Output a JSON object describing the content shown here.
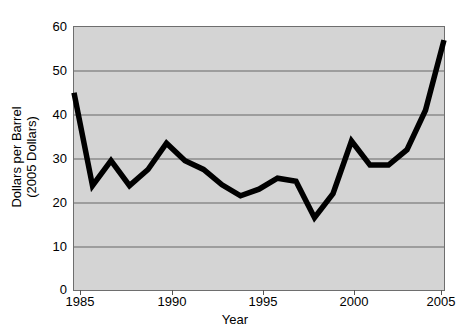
{
  "chart_data": {
    "type": "line",
    "title": "",
    "xlabel": "Year",
    "ylabel": "Dollars per Barrel (2005 Dollars)",
    "ylabel_line1": "Dollars per Barrel",
    "ylabel_line2": "(2005 Dollars)",
    "xlim": [
      1985,
      2005
    ],
    "ylim": [
      0,
      60
    ],
    "grid": true,
    "legend": "none",
    "y_ticks": [
      60,
      50,
      40,
      30,
      20,
      10,
      0
    ],
    "y_tick_labels": [
      "60",
      "50",
      "40",
      "30",
      "20",
      "10",
      "0"
    ],
    "x_ticks": [
      1985,
      1990,
      1995,
      2000,
      2005
    ],
    "x_tick_labels": [
      "1985",
      "1990",
      "1995",
      "2000",
      "2005"
    ],
    "series": [
      {
        "name": "Crude oil price",
        "color": "#000000",
        "x": [
          1985,
          1986,
          1987,
          1988,
          1989,
          1990,
          1991,
          1992,
          1993,
          1994,
          1995,
          1996,
          1997,
          1998,
          1999,
          2000,
          2001,
          2002,
          2003,
          2004,
          2005
        ],
        "values": [
          45.0,
          23.8,
          29.5,
          23.8,
          27.5,
          33.5,
          29.5,
          27.5,
          24.0,
          21.5,
          23.0,
          25.5,
          24.8,
          16.5,
          22.0,
          34.0,
          28.5,
          28.5,
          32.0,
          41.0,
          57.0
        ]
      }
    ],
    "colors": {
      "plot_background": "#d4d4d4",
      "gridline": "#666666",
      "axis": "#555555",
      "line": "#000000",
      "text": "#000000",
      "page_background": "#ffffff"
    }
  }
}
